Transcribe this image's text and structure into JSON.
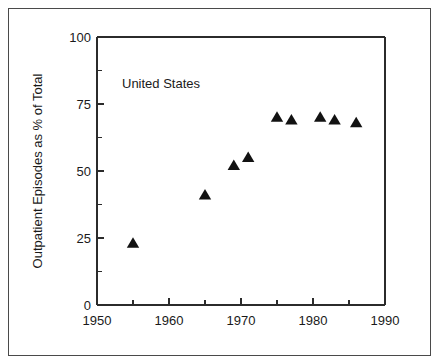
{
  "chart_data": {
    "type": "scatter",
    "title": "",
    "subtitle": "",
    "xlabel": "",
    "ylabel": "Outpatient Episodes as % of Total",
    "xlim": [
      1950,
      1990
    ],
    "ylim": [
      0,
      100
    ],
    "grid": false,
    "legend": null,
    "annotations": [
      {
        "text": "United States",
        "x": 1957,
        "y": 85
      }
    ],
    "x_ticks": [
      1950,
      1960,
      1970,
      1980,
      1990
    ],
    "x_tick_labels": [
      "1950",
      "1960",
      "1970",
      "1980",
      "1990"
    ],
    "x_minor_ticks": [
      1955,
      1965,
      1975,
      1985
    ],
    "y_ticks": [
      0,
      25,
      50,
      75,
      100
    ],
    "y_tick_labels": [
      "0",
      "25",
      "50",
      "75",
      "100"
    ],
    "y_minor_ticks": [
      12.5,
      37.5,
      62.5,
      87.5
    ],
    "marker": "triangle",
    "marker_color": "#121212",
    "series": [
      {
        "name": "United States",
        "points": [
          {
            "x": 1955,
            "y": 23
          },
          {
            "x": 1965,
            "y": 41
          },
          {
            "x": 1969,
            "y": 52
          },
          {
            "x": 1971,
            "y": 55
          },
          {
            "x": 1975,
            "y": 70
          },
          {
            "x": 1977,
            "y": 69
          },
          {
            "x": 1981,
            "y": 70
          },
          {
            "x": 1983,
            "y": 69
          },
          {
            "x": 1986,
            "y": 68
          }
        ]
      }
    ]
  },
  "figure": {
    "border_color": "#4a4a4a",
    "background": "#ffffff",
    "axis_color": "#2b2b2b"
  }
}
